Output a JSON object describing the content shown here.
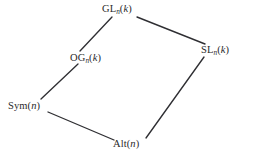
{
  "diagram": {
    "type": "lattice-diagram",
    "background_color": "#ffffff",
    "line_color": "#2f2f33",
    "text_color": "#2a2a2a",
    "nodes": [
      {
        "id": "gl",
        "label": "GL_n(k)",
        "base": "GL",
        "subscript": "n",
        "argument": "(k)",
        "arg_open": "(",
        "arg_var": "k",
        "arg_close": ")",
        "x": 102,
        "y": 4
      },
      {
        "id": "sl",
        "label": "SL_n(k)",
        "base": "SL",
        "subscript": "n",
        "argument": "(k)",
        "arg_open": "(",
        "arg_var": "k",
        "arg_close": ")",
        "x": 201,
        "y": 45
      },
      {
        "id": "og",
        "label": "OG_n(k)",
        "base": "OG",
        "subscript": "n",
        "argument": "(k)",
        "arg_open": "(",
        "arg_var": "k",
        "arg_close": ")",
        "x": 70,
        "y": 53
      },
      {
        "id": "sym",
        "label": "Sym(n)",
        "base": "Sym",
        "subscript": "",
        "argument": "(n)",
        "arg_open": "(",
        "arg_var": "n",
        "arg_close": ")",
        "x": 8,
        "y": 101
      },
      {
        "id": "alt",
        "label": "Alt(n)",
        "base": "Alt",
        "subscript": "",
        "argument": "(n)",
        "arg_open": "(",
        "arg_var": "n",
        "arg_close": ")",
        "x": 113,
        "y": 139
      }
    ],
    "edges": [
      {
        "id": "gl-og",
        "from": "gl",
        "to": "og",
        "x1": 112,
        "y1": 17,
        "x2": 80,
        "y2": 51
      },
      {
        "id": "gl-sl",
        "from": "gl",
        "to": "sl",
        "x1": 137,
        "y1": 17,
        "x2": 205,
        "y2": 44
      },
      {
        "id": "og-sym",
        "from": "og",
        "to": "sym",
        "x1": 78,
        "y1": 64,
        "x2": 41,
        "y2": 99
      },
      {
        "id": "sym-alt",
        "from": "sym",
        "to": "alt",
        "x1": 48,
        "y1": 112,
        "x2": 114,
        "y2": 140
      },
      {
        "id": "sl-alt",
        "from": "sl",
        "to": "alt",
        "x1": 204,
        "y1": 57,
        "x2": 146,
        "y2": 138
      }
    ]
  }
}
